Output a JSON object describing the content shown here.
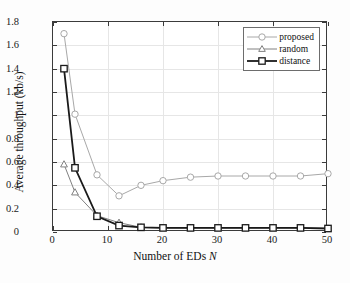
{
  "chart_data": {
    "type": "line",
    "title": "",
    "xlabel": "Number of EDs N",
    "ylabel": "Average throughput (kb/s)",
    "xlim": [
      0,
      50
    ],
    "ylim": [
      0,
      1.8
    ],
    "xticks": [
      0,
      10,
      20,
      30,
      40,
      50
    ],
    "yticks": [
      0,
      0.2,
      0.4,
      0.6,
      0.8,
      1,
      1.2,
      1.4,
      1.6,
      1.8
    ],
    "xticklabels": [
      "0",
      "10",
      "20",
      "30",
      "40",
      "50"
    ],
    "yticklabels": [
      "0",
      "0.2",
      "0.4",
      "0.6",
      "0.8",
      "1",
      "1.2",
      "1.4",
      "1.6",
      "1.8"
    ],
    "grid": true,
    "legend_position": "upper right",
    "x": [
      2,
      4,
      8,
      12,
      16,
      20,
      25,
      30,
      35,
      40,
      45,
      50
    ],
    "series": [
      {
        "name": "proposed",
        "marker": "circle",
        "color": "#a8a8a8",
        "values": [
          1.7,
          1.01,
          0.49,
          0.31,
          0.4,
          0.44,
          0.47,
          0.48,
          0.48,
          0.48,
          0.48,
          0.5
        ]
      },
      {
        "name": "random",
        "marker": "triangle",
        "color": "#808080",
        "values": [
          0.58,
          0.34,
          0.14,
          0.08,
          0.04,
          0.035,
          0.035,
          0.035,
          0.035,
          0.035,
          0.035,
          0.03
        ]
      },
      {
        "name": "distance",
        "marker": "square",
        "color": "#1a1a1a",
        "values": [
          1.4,
          0.55,
          0.135,
          0.055,
          0.04,
          0.035,
          0.035,
          0.035,
          0.035,
          0.035,
          0.035,
          0.03
        ]
      }
    ]
  },
  "legend": {
    "items": [
      {
        "label": "proposed"
      },
      {
        "label": "random"
      },
      {
        "label": "distance"
      }
    ]
  }
}
